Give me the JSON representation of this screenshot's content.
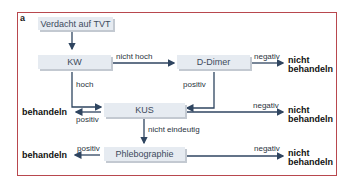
{
  "panel_label": "a",
  "nodes": {
    "start": "Verdacht auf TVT",
    "kw": "KW",
    "ddimer": "D-Dimer",
    "kus": "KUS",
    "phlebo": "Phlebographie"
  },
  "edge_labels": {
    "kw_ddimer": "nicht hoch",
    "kw_kus": "hoch",
    "ddimer_neg": "negativ",
    "ddimer_kus": "positiv",
    "kus_pos": "positiv",
    "kus_neg": "negativ",
    "kus_phlebo": "nicht eindeutig",
    "phlebo_pos": "positiv",
    "phlebo_neg": "negativ"
  },
  "outcomes": {
    "ddimer_neg": "nicht\nbehandeln",
    "kus_pos": "behandeln",
    "kus_neg": "nicht\nbehandeln",
    "phlebo_pos": "behandeln",
    "phlebo_neg": "nicht\nbehandeln"
  },
  "colors": {
    "frame": "#b8484e",
    "box_fill": "#e6ebf1",
    "arrow": "#2f4560"
  }
}
